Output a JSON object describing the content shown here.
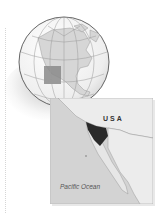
{
  "figure": {
    "type": "locator-map",
    "globe": {
      "region": "North America",
      "highlight": "Baja California / Southwestern North America",
      "colors": {
        "ocean": "#f2f2f2",
        "land": "#d8d8d8",
        "highlight": "#8a8a8a",
        "outline": "#555555"
      }
    },
    "inset": {
      "labels": {
        "country": "USA",
        "ocean": "Pacific Ocean"
      },
      "colors": {
        "sea": "#d3d3d3",
        "land": "#ececec",
        "highlight": "#2a2a2a",
        "border": "#bdbdbd"
      }
    }
  }
}
